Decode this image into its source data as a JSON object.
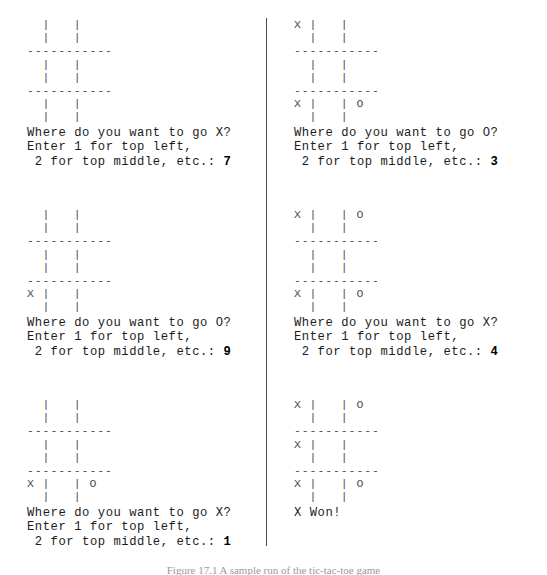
{
  "figure": {
    "background_color": "#ffffff",
    "text_color": "#1b1b1b",
    "board_color": "#4c4c4c",
    "divider_color": "#4a4a4a"
  },
  "caption": {
    "label": "Figure 17.1",
    "text": "Figure 17.1 A sample run of the tic-tac-toe game"
  },
  "prompt": {
    "line1_x": "Where do you want to go X?",
    "line1_o": "Where do you want to go O?",
    "line2": "Enter 1 for top left,",
    "line3": " 2 for top middle, etc.: "
  },
  "left_column": {
    "sessions": [
      {
        "board": "  |   |\n  |   |\n-----------\n  |   |\n  |   |\n-----------\n  |   |\n  |   |",
        "prompt_line1": "Where do you want to go X?",
        "prompt_line2": "Enter 1 for top left,",
        "prompt_line3": " 2 for top middle, etc.: ",
        "answer": "7",
        "player": "X"
      },
      {
        "board": "  |   |\n  |   |\n-----------\n  |   |\n  |   |\n-----------\nX |   |\n  |   |",
        "prompt_line1": "Where do you want to go O?",
        "prompt_line2": "Enter 1 for top left,",
        "prompt_line3": " 2 for top middle, etc.: ",
        "answer": "9",
        "player": "O"
      },
      {
        "board": "  |   |\n  |   |\n-----------\n  |   |\n  |   |\n-----------\nX |   | O\n  |   |",
        "prompt_line1": "Where do you want to go X?",
        "prompt_line2": "Enter 1 for top left,",
        "prompt_line3": " 2 for top middle, etc.: ",
        "answer": "1",
        "player": "X"
      }
    ]
  },
  "right_column": {
    "sessions": [
      {
        "board": "X |   |\n  |   |\n-----------\n  |   |\n  |   |\n-----------\nX |   | O\n  |   |",
        "prompt_line1": "Where do you want to go O?",
        "prompt_line2": "Enter 1 for top left,",
        "prompt_line3": " 2 for top middle, etc.: ",
        "answer": "3",
        "player": "O"
      },
      {
        "board": "X |   | O\n  |   |\n-----------\n  |   |\n  |   |\n-----------\nX |   | O\n  |   |",
        "prompt_line1": "Where do you want to go X?",
        "prompt_line2": "Enter 1 for top left,",
        "prompt_line3": " 2 for top middle, etc.: ",
        "answer": "4",
        "player": "X"
      },
      {
        "board": "X |   | O\n  |   |\n-----------\nX |   |\n  |   |\n-----------\nX |   | O\n  |   |",
        "result": "X Won!"
      }
    ]
  }
}
